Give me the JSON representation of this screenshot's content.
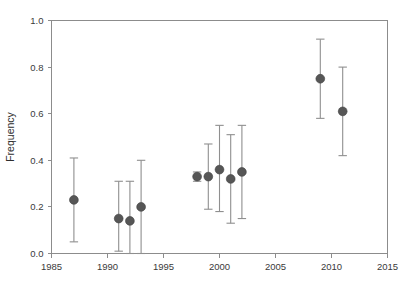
{
  "chart_data": {
    "type": "scatter",
    "title": "",
    "subtitle": "",
    "xlabel": "",
    "ylabel": "Frequency",
    "xlim": [
      1985,
      2015
    ],
    "ylim": [
      0.0,
      1.0
    ],
    "xticks": [
      1985,
      1990,
      1995,
      2000,
      2005,
      2010,
      2015
    ],
    "xtick_labels": [
      "1985",
      "1990",
      "1995",
      "2000",
      "2005",
      "2010",
      "2015"
    ],
    "yticks": [
      0.0,
      0.2,
      0.4,
      0.6,
      0.8,
      1.0
    ],
    "ytick_labels": [
      "0.0",
      "0.2",
      "0.4",
      "0.6",
      "0.8",
      "1.0"
    ],
    "grid": false,
    "legend": null,
    "marker_color": "#565656",
    "errorbar_color": "#8f8f8f",
    "axis_color": "#8c8c8c",
    "background_color": "#ffffff",
    "error_type": "error bars (upper/lower bounds)",
    "x": [
      1987,
      1991,
      1992,
      1993,
      1998,
      1999,
      2000,
      2001,
      2002,
      2009,
      2011
    ],
    "y": [
      0.23,
      0.15,
      0.14,
      0.2,
      0.33,
      0.33,
      0.36,
      0.32,
      0.35,
      0.75,
      0.61
    ],
    "y_upper": [
      0.41,
      0.31,
      0.31,
      0.4,
      0.35,
      0.47,
      0.55,
      0.51,
      0.55,
      0.92,
      0.8
    ],
    "y_lower": [
      0.05,
      0.01,
      0.0,
      0.0,
      0.31,
      0.19,
      0.18,
      0.13,
      0.15,
      0.58,
      0.42
    ],
    "points": [
      {
        "x": 1987,
        "y": 0.23,
        "upper": 0.41,
        "lower": 0.05
      },
      {
        "x": 1991,
        "y": 0.15,
        "upper": 0.31,
        "lower": 0.01
      },
      {
        "x": 1992,
        "y": 0.14,
        "upper": 0.31,
        "lower": 0.0
      },
      {
        "x": 1993,
        "y": 0.2,
        "upper": 0.4,
        "lower": 0.0
      },
      {
        "x": 1998,
        "y": 0.33,
        "upper": 0.35,
        "lower": 0.31
      },
      {
        "x": 1999,
        "y": 0.33,
        "upper": 0.47,
        "lower": 0.19
      },
      {
        "x": 2000,
        "y": 0.36,
        "upper": 0.55,
        "lower": 0.18
      },
      {
        "x": 2001,
        "y": 0.32,
        "upper": 0.51,
        "lower": 0.13
      },
      {
        "x": 2002,
        "y": 0.35,
        "upper": 0.55,
        "lower": 0.15
      },
      {
        "x": 2009,
        "y": 0.75,
        "upper": 0.92,
        "lower": 0.58
      },
      {
        "x": 2011,
        "y": 0.61,
        "upper": 0.8,
        "lower": 0.42
      }
    ]
  }
}
